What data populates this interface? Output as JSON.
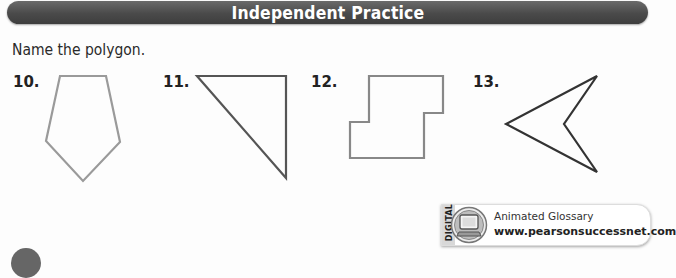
{
  "header": {
    "title": "Independent Practice",
    "color": "#4a4a4a"
  },
  "instruction": "Name the polygon.",
  "problems": [
    {
      "number": "10.",
      "shape": "pentagon",
      "stroke": "#999999"
    },
    {
      "number": "11.",
      "shape": "triangle",
      "stroke": "#555555"
    },
    {
      "number": "12.",
      "shape": "octagon",
      "stroke": "#888888"
    },
    {
      "number": "13.",
      "shape": "quadrilateral",
      "stroke": "#333333"
    }
  ],
  "glossary": {
    "tab_label": "DIGITAL",
    "icon": "computer-icon",
    "label": "Animated Glossary",
    "url": "www.pearsonsuccessnet.com"
  }
}
